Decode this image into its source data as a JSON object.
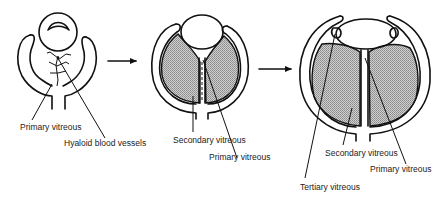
{
  "figure": {
    "topic": "Development of the vitreous",
    "stages": [
      {
        "id": "stage-1",
        "labels": [
          "Primary vitreous",
          "Hyaloid blood vessels"
        ]
      },
      {
        "id": "stage-2",
        "labels": [
          "Secondary vitreous",
          "Primary vitreous"
        ]
      },
      {
        "id": "stage-3",
        "labels": [
          "Secondary vitreous",
          "Primary vitreous",
          "Tertiary vitreous"
        ]
      }
    ],
    "arrows": [
      "stage-1 to stage-2",
      "stage-2 to stage-3"
    ],
    "colors": {
      "line": "#111111",
      "shading": "#a8a8a8",
      "background": "#ffffff"
    }
  }
}
